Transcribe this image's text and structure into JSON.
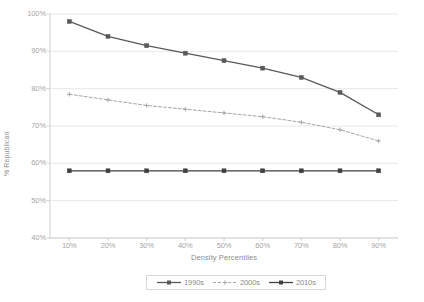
{
  "chart_data": {
    "type": "line",
    "title": "",
    "xlabel": "Density Percentiles",
    "ylabel": "% Republican",
    "categories": [
      "10%",
      "20%",
      "30%",
      "40%",
      "50%",
      "60%",
      "70%",
      "80%",
      "90%"
    ],
    "x": [
      10,
      20,
      30,
      40,
      50,
      60,
      70,
      80,
      90
    ],
    "xlim": [
      5,
      95
    ],
    "ylim": [
      40,
      100
    ],
    "ytick_labels": [
      "100%",
      "90%",
      "80%",
      "70%",
      "60%",
      "50%",
      "40%"
    ],
    "ytick_values": [
      100,
      90,
      80,
      70,
      60,
      50,
      40
    ],
    "grid": "horizontal",
    "legend_position": "bottom",
    "series": [
      {
        "name": "1990s",
        "values": [
          98.0,
          94.0,
          91.5,
          89.5,
          87.5,
          85.5,
          83.0,
          79.0,
          73.0
        ],
        "color": "#595959",
        "style": "solid",
        "marker": "square"
      },
      {
        "name": "2000s",
        "values": [
          78.5,
          77.0,
          75.5,
          74.5,
          73.5,
          72.5,
          71.0,
          69.0,
          66.0
        ],
        "color": "#a6a6a6",
        "style": "dashed",
        "marker": "plus"
      },
      {
        "name": "2010s",
        "values": [
          58.0,
          58.0,
          58.0,
          58.0,
          58.0,
          58.0,
          58.0,
          58.0,
          58.0
        ],
        "color": "#404040",
        "style": "solid",
        "marker": "square"
      }
    ]
  },
  "axes": {
    "y_title": "% Republican",
    "x_title": "Density Percentiles"
  },
  "legend": {
    "items": [
      {
        "label": "1990s"
      },
      {
        "label": "2000s"
      },
      {
        "label": "2010s"
      }
    ]
  },
  "colors": {
    "series_1990s": "#595959",
    "series_2000s": "#a6a6a6",
    "series_2010s": "#404040",
    "gridline": "#e8e8e8",
    "axis": "#d0d0d0",
    "tick_text": "#a6a6a6",
    "title_text": "#8c8c8c",
    "background": "#ffffff"
  }
}
